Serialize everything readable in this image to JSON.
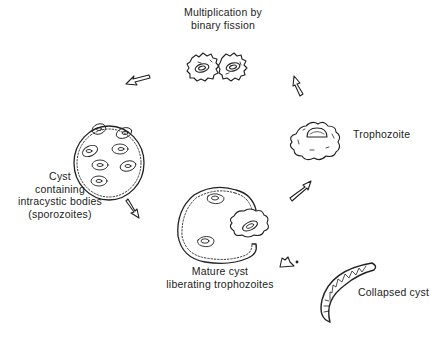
{
  "stages": {
    "fission": {
      "label_line1": "Multiplication by",
      "label_line2": "binary fission"
    },
    "trophozoite": {
      "label": "Trophozoite"
    },
    "cyst": {
      "label_line1": "Cyst",
      "label_line2": "containing",
      "label_line3": "intracystic bodies",
      "label_line4": "(sporozoites)"
    },
    "mature_cyst": {
      "label_line1": "Mature cyst",
      "label_line2": "liberating trophozoites"
    },
    "collapsed_cyst": {
      "label": "Collapsed cyst"
    }
  },
  "colors": {
    "ink": "#222222",
    "background": "#ffffff"
  }
}
